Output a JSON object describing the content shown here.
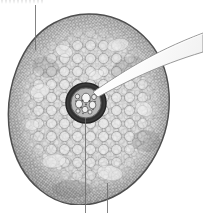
{
  "figure": {
    "caption": "",
    "width": 203,
    "height": 213,
    "background_color": "#ffffff",
    "magnification_note": "",
    "ghost_text": ""
  },
  "specimen": {
    "name": "root-cross-section",
    "outline_color": "#5a5a5a",
    "tissue_fill": "#d8d8d8",
    "shape": "ovoid",
    "regions": [
      {
        "name": "epidermis",
        "label": "",
        "color": "#8a8a8a",
        "description": "thin outer layer of small tightly packed cells"
      },
      {
        "name": "cortex",
        "label": "",
        "color": "#cfcfcf",
        "description": "broad zone of large rounded parenchyma cells"
      },
      {
        "name": "stele",
        "label": "",
        "color": "#6b6b6b",
        "description": "central vascular cylinder with dark endodermal ring"
      },
      {
        "name": "xylem-vessels",
        "label": "",
        "color": "#f2f2f2",
        "description": "pale large vessel elements inside the stele"
      }
    ]
  },
  "annotations": {
    "pointer": {
      "name": "pointer-arrow",
      "color": "#ffffff",
      "stroke": "#8d8d8d",
      "target": "stele",
      "label": "",
      "enters_from": "right edge"
    },
    "leaders": [
      {
        "name": "leader-top",
        "label": "",
        "x": 35,
        "y1": 5,
        "y2": 50
      },
      {
        "name": "leader-bottom-left",
        "label": "",
        "x": 85,
        "y1": 118,
        "y2": 213
      },
      {
        "name": "leader-bottom-right",
        "label": "",
        "x": 107,
        "y1": 183,
        "y2": 213
      }
    ]
  },
  "colors": {
    "background": "#ffffff",
    "ink": "#5a5a5a",
    "tissue_light": "#e4e4e4",
    "tissue_mid": "#c6c6c6",
    "tissue_dark": "#8f8f8f",
    "stele_ring": "#3e3e3e",
    "leader": "#6e6e6e",
    "pointer": "#ffffff"
  }
}
